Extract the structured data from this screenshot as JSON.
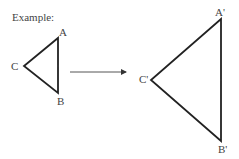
{
  "title": "Example:",
  "original_triangle": {
    "vertices": {
      "A": [
        58,
        38
      ],
      "B": [
        58,
        93
      ],
      "C": [
        24,
        66
      ]
    },
    "labels": {
      "A": "A",
      "B": "B",
      "C": "C"
    }
  },
  "image_triangle": {
    "vertices": {
      "A": [
        221,
        19
      ],
      "B": [
        221,
        141
      ],
      "C": [
        151,
        80
      ]
    },
    "labels": {
      "A": "A'",
      "B": "B'",
      "C": "C'"
    }
  },
  "arrow": {
    "from": [
      70,
      72
    ],
    "to": [
      127,
      72
    ]
  },
  "colors": {
    "stroke": "#222222",
    "text": "#444444"
  }
}
